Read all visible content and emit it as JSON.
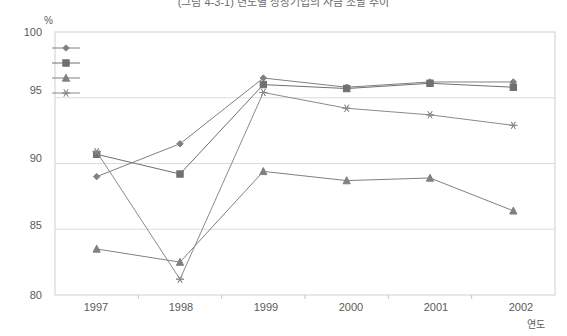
{
  "chart_data": {
    "type": "line",
    "title": "(그림 4-3-1) 년도별 상장기업의 자금 조달 추이",
    "ylabel": "%",
    "xlabel": "연도",
    "categories": [
      "1997",
      "1998",
      "1999",
      "2000",
      "2001",
      "2002"
    ],
    "ylim": [
      80,
      100
    ],
    "yticks": [
      "80",
      "85",
      "90",
      "95",
      "100"
    ],
    "grid": true,
    "legend_position": "top-left-inside",
    "series": [
      {
        "name": "매출액",
        "marker": "diamond",
        "color": "#808080",
        "values": [
          89.0,
          91.5,
          96.5,
          95.8,
          96.2,
          96.2
        ]
      },
      {
        "name": "총자산",
        "marker": "square",
        "color": "#707070",
        "values": [
          90.7,
          89.2,
          96.0,
          95.7,
          96.1,
          95.8
        ]
      },
      {
        "name": "자본금",
        "marker": "triangle",
        "color": "#808080",
        "values": [
          83.5,
          82.5,
          89.4,
          88.7,
          88.9,
          86.4
        ]
      },
      {
        "name": "자기자본",
        "marker": "asterisk",
        "color": "#8a8a8a",
        "values": [
          90.9,
          81.2,
          95.4,
          94.2,
          93.7,
          92.9
        ]
      }
    ]
  }
}
